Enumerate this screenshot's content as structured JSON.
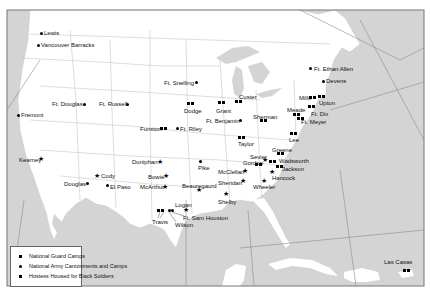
{
  "map": {
    "frame": {
      "x": 7,
      "y": 10,
      "width": 417,
      "height": 276
    },
    "colors": {
      "land": "#ffffff",
      "water": "#d4d4d4",
      "border": "#b8b8b8",
      "frame": "#777777",
      "marker": "#000000"
    }
  },
  "legend": {
    "items": [
      {
        "symbol": "star",
        "label": "National Guard Camps"
      },
      {
        "symbol": "dot",
        "label": "National Army Cantonments and Camps"
      },
      {
        "symbol": "square",
        "label": "Hostess Housed for Black Soldiers"
      }
    ]
  },
  "sites": [
    {
      "name": "Lewis",
      "type": "army",
      "x": 41,
      "y": 33,
      "lx": 44,
      "ly": 30
    },
    {
      "name": "Vancouver Barracks",
      "type": "army",
      "x": 38,
      "y": 45,
      "lx": 41,
      "ly": 42
    },
    {
      "name": "Ft. Douglas",
      "type": "army",
      "x": 84,
      "y": 104,
      "lx": 52,
      "ly": 101
    },
    {
      "name": "Ft. Russell",
      "type": "army",
      "x": 127,
      "y": 104,
      "lx": 99,
      "ly": 101
    },
    {
      "name": "Fremont",
      "type": "army",
      "x": 18,
      "y": 115,
      "lx": 21,
      "ly": 112
    },
    {
      "name": "Kearney",
      "type": "guard",
      "x": 41,
      "y": 159,
      "lx": 19,
      "ly": 157
    },
    {
      "name": "Cody",
      "type": "guard",
      "x": 97,
      "y": 176,
      "lx": 101,
      "ly": 173
    },
    {
      "name": "Douglas",
      "type": "army",
      "x": 87,
      "y": 183,
      "lx": 64,
      "ly": 181
    },
    {
      "name": "El Paso",
      "type": "army",
      "x": 107,
      "y": 185,
      "lx": 110,
      "ly": 184
    },
    {
      "name": "Ft. Snelling",
      "type": "army",
      "x": 196,
      "y": 82,
      "lx": 164,
      "ly": 80
    },
    {
      "name": "Dodge",
      "type": "hostess",
      "x": 190,
      "y": 103,
      "lx": 184,
      "ly": 108
    },
    {
      "name": "Grant",
      "type": "hostess",
      "x": 221,
      "y": 102,
      "lx": 216,
      "ly": 108
    },
    {
      "name": "Custer",
      "type": "hostess",
      "x": 238,
      "y": 101,
      "lx": 239,
      "ly": 94
    },
    {
      "name": "Ft. Benjamin",
      "type": "army",
      "x": 240,
      "y": 120,
      "lx": 206,
      "ly": 118
    },
    {
      "name": "Sherman",
      "type": "hostess",
      "x": 263,
      "y": 120,
      "lx": 253,
      "ly": 114
    },
    {
      "name": "Funston",
      "type": "hostess",
      "x": 163,
      "y": 128,
      "lx": 140,
      "ly": 126
    },
    {
      "name": "Ft. Riley",
      "type": "army",
      "x": 177,
      "y": 128,
      "lx": 180,
      "ly": 126
    },
    {
      "name": "Taylor",
      "type": "hostess",
      "x": 241,
      "y": 137,
      "lx": 238,
      "ly": 141
    },
    {
      "name": "Ft. Ethan Allen",
      "type": "army",
      "x": 310,
      "y": 68,
      "lx": 314,
      "ly": 66
    },
    {
      "name": "Devens",
      "type": "army",
      "x": 323,
      "y": 81,
      "lx": 326,
      "ly": 78
    },
    {
      "name": "Mills",
      "type": "hostess",
      "x": 312,
      "y": 97,
      "lx": 299,
      "ly": 95
    },
    {
      "name": "Upton",
      "type": "hostess",
      "x": 321,
      "y": 96,
      "lx": 319,
      "ly": 100
    },
    {
      "name": "Ft. Dix",
      "type": "hostess",
      "x": 311,
      "y": 106,
      "lx": 311,
      "ly": 111
    },
    {
      "name": "Meade",
      "type": "hostess",
      "x": 296,
      "y": 114,
      "lx": 287,
      "ly": 107
    },
    {
      "name": "Ft. Meyer",
      "type": "hostess",
      "x": 300,
      "y": 118,
      "lx": 301,
      "ly": 119
    },
    {
      "name": "Lee",
      "type": "hostess",
      "x": 293,
      "y": 133,
      "lx": 289,
      "ly": 137
    },
    {
      "name": "Greene",
      "type": "hostess",
      "x": 280,
      "y": 153,
      "lx": 272,
      "ly": 147
    },
    {
      "name": "Sevier",
      "type": "guard",
      "x": 265,
      "y": 160,
      "lx": 250,
      "ly": 154
    },
    {
      "name": "Gordon",
      "type": "hostess",
      "x": 258,
      "y": 164,
      "lx": 243,
      "ly": 160
    },
    {
      "name": "Wadsworth",
      "type": "hostess",
      "x": 272,
      "y": 161,
      "lx": 279,
      "ly": 158
    },
    {
      "name": "Jackson",
      "type": "hostess",
      "x": 279,
      "y": 166,
      "lx": 282,
      "ly": 166
    },
    {
      "name": "Hancock",
      "type": "guard",
      "x": 272,
      "y": 172,
      "lx": 272,
      "ly": 175
    },
    {
      "name": "Wheeler",
      "type": "guard",
      "x": 264,
      "y": 181,
      "lx": 253,
      "ly": 184
    },
    {
      "name": "McClellan",
      "type": "guard",
      "x": 245,
      "y": 171,
      "lx": 218,
      "ly": 169
    },
    {
      "name": "Sheridan",
      "type": "guard",
      "x": 243,
      "y": 181,
      "lx": 218,
      "ly": 180
    },
    {
      "name": "Shelby",
      "type": "guard",
      "x": 226,
      "y": 194,
      "lx": 218,
      "ly": 199
    },
    {
      "name": "Pike",
      "type": "army",
      "x": 200,
      "y": 161,
      "lx": 198,
      "ly": 165
    },
    {
      "name": "Beauregaurd",
      "type": "guard",
      "x": 199,
      "y": 190,
      "lx": 182,
      "ly": 183
    },
    {
      "name": "Doniphan",
      "type": "guard",
      "x": 160,
      "y": 162,
      "lx": 132,
      "ly": 159
    },
    {
      "name": "Bowie",
      "type": "guard",
      "x": 166,
      "y": 176,
      "lx": 148,
      "ly": 174
    },
    {
      "name": "McArthur",
      "type": "guard",
      "x": 165,
      "y": 187,
      "lx": 140,
      "ly": 184
    },
    {
      "name": "Logan",
      "type": "guard",
      "x": 186,
      "y": 210,
      "lx": 175,
      "ly": 202
    },
    {
      "name": "Travis",
      "type": "hostess",
      "x": 160,
      "y": 210,
      "lx": 152,
      "ly": 219
    },
    {
      "name": "Ft. Sam Houston",
      "type": "army",
      "x": 169,
      "y": 210,
      "lx": 183,
      "ly": 215
    },
    {
      "name": "Wilson",
      "type": "army",
      "x": 172,
      "y": 210,
      "lx": 175,
      "ly": 222
    },
    {
      "name": "Las Casas",
      "type": "hostess",
      "x": 406,
      "y": 270,
      "lx": 384,
      "ly": 259
    }
  ]
}
